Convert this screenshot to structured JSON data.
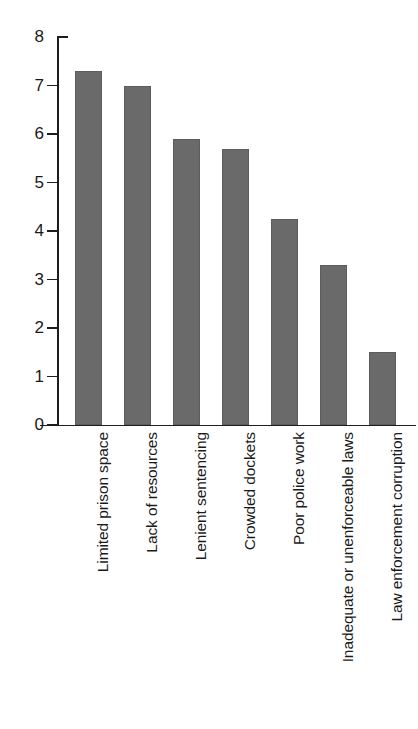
{
  "chart_data": {
    "type": "bar",
    "title": "",
    "subtitle": "",
    "xlabel": "",
    "ylabel": "",
    "ylim": [
      0,
      8
    ],
    "yticks": [
      "0",
      "1",
      "2",
      "3",
      "4",
      "5",
      "6",
      "7",
      "8"
    ],
    "grid": false,
    "legend": false,
    "orientation": "vertical",
    "bar_color": "#6a6a6a",
    "axis_color": "#1d1d1d",
    "background": "#ffffff",
    "categories": [
      "Limited prison space",
      "Lack of resources",
      "Lenient sentencing",
      "Crowded dockets",
      "Poor police work",
      "Inadequate or unenforceable laws",
      "Law enforcement corruption"
    ],
    "values": [
      7.3,
      7.0,
      5.9,
      5.7,
      4.25,
      3.3,
      1.5
    ]
  }
}
